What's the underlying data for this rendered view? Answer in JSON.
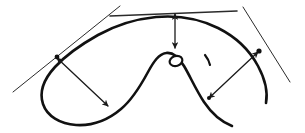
{
  "figure": {
    "title": "Hand-drawn closed curve with tangent lines and dimension arrows",
    "canvas": {
      "width": 305,
      "height": 133,
      "background": "#ffffff"
    },
    "ink_color": "#111111",
    "tangent_color": "#2b2b2b",
    "arrow_color": "#1a1a1a"
  },
  "curve": {
    "name": "main-outline",
    "description": "closed freehand outline with a central peak and a left loop",
    "stroke_width": 2.6,
    "path": "M 232 126 C 222 122 212 114 204 102 C 196 90 190 76 184 66 C 178 56 172 52 166 53 C 159 54 154 61 148 72 C 141 85 133 99 121 109 C 108 120 92 126 76 125 C 60 124 47 116 43 104 C 39 92 44 79 55 67 C 66 55 82 44 98 35 C 116 25 136 19 156 17 C 178 15 200 19 218 28 C 236 37 250 51 258 66 C 265 79 268 92 266 103",
    "segments": [
      {
        "name": "lower-right-tail",
        "from": [
          232,
          126
        ],
        "to": [
          204,
          102
        ]
      },
      {
        "name": "central-right-flank",
        "from": [
          204,
          102
        ],
        "to": [
          166,
          53
        ]
      },
      {
        "name": "central-left-flank",
        "from": [
          166,
          53
        ],
        "to": [
          121,
          109
        ]
      },
      {
        "name": "left-loop-bottom",
        "from": [
          121,
          109
        ],
        "to": [
          43,
          104
        ]
      },
      {
        "name": "left-loop-rise",
        "from": [
          43,
          104
        ],
        "to": [
          98,
          35
        ]
      },
      {
        "name": "top-arc",
        "from": [
          98,
          35
        ],
        "to": [
          218,
          28
        ]
      },
      {
        "name": "right-descent",
        "from": [
          218,
          28
        ],
        "to": [
          266,
          103
        ]
      }
    ]
  },
  "tangent_lines": [
    {
      "name": "tangent-left",
      "stroke_width": 1.0,
      "from": [
        13,
        92
      ],
      "to": [
        120,
        6
      ],
      "touch_point": [
        57,
        57
      ]
    },
    {
      "name": "tangent-top",
      "stroke_width": 1.6,
      "from": [
        110,
        16
      ],
      "to": [
        237,
        11
      ],
      "touch_point": [
        175,
        13
      ]
    },
    {
      "name": "tangent-right",
      "stroke_width": 1.0,
      "from": [
        243,
        7
      ],
      "to": [
        290,
        82
      ],
      "touch_point": [
        259,
        51
      ]
    }
  ],
  "dimension_arrows": [
    {
      "name": "arrow-left-diagonal",
      "stroke_width": 1.3,
      "double_headed": true,
      "from": [
        57,
        58
      ],
      "to": [
        108,
        106
      ],
      "label": ""
    },
    {
      "name": "arrow-center-vertical",
      "stroke_width": 1.3,
      "double_headed": true,
      "from": [
        175,
        14
      ],
      "to": [
        175,
        48
      ],
      "label": ""
    },
    {
      "name": "arrow-right-diagonal",
      "stroke_width": 1.3,
      "double_headed": true,
      "from": [
        258,
        52
      ],
      "to": [
        209,
        98
      ],
      "label": ""
    }
  ],
  "markers": [
    {
      "name": "ellipse-marker",
      "type": "hollow-ellipse",
      "center": [
        176,
        61
      ],
      "rx": 6.5,
      "ry": 5.0,
      "rotation": -18,
      "stroke_width": 2.2
    },
    {
      "name": "tick-mark",
      "type": "comma-tick",
      "from": [
        205,
        55
      ],
      "to": [
        210,
        65
      ],
      "stroke_width": 2.2
    },
    {
      "name": "junction-dot-left",
      "type": "dot",
      "center": [
        57,
        57
      ],
      "r": 2.4
    },
    {
      "name": "junction-dot-right",
      "type": "dot",
      "center": [
        259,
        51
      ],
      "r": 2.6
    },
    {
      "name": "junction-dot-bottom-right",
      "type": "dot",
      "center": [
        209,
        98
      ],
      "r": 2.0
    }
  ]
}
